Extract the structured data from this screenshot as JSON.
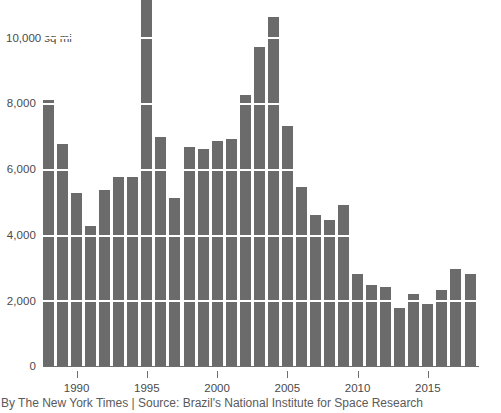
{
  "chart_data": {
    "type": "bar",
    "title": "",
    "subtitle": "",
    "xlabel": "",
    "ylabel": "10,000 sq mi",
    "unit_note": "10,000 sq mi",
    "ylim": [
      0,
      11500
    ],
    "xlim": [
      1987.5,
      2018.5
    ],
    "grid": true,
    "gridlines": [
      2000,
      4000,
      6000,
      8000,
      10000
    ],
    "legend": null,
    "ytick_labels": [
      "0",
      "2,000",
      "4,000",
      "6,000",
      "8,000",
      "10,000 sq mi"
    ],
    "ytick_values": [
      0,
      2000,
      4000,
      6000,
      8000,
      10000
    ],
    "xtick_labels": [
      "1990",
      "1995",
      "2000",
      "2005",
      "2010",
      "2015"
    ],
    "xtick_values": [
      1990,
      1995,
      2000,
      2005,
      2010,
      2015
    ],
    "categories": [
      1988,
      1989,
      1990,
      1991,
      1992,
      1993,
      1994,
      1995,
      1996,
      1997,
      1998,
      1999,
      2000,
      2001,
      2002,
      2003,
      2004,
      2005,
      2006,
      2007,
      2008,
      2009,
      2010,
      2011,
      2012,
      2013,
      2014,
      2015,
      2016,
      2017,
      2018
    ],
    "values": [
      8100,
      6750,
      5250,
      4250,
      5350,
      5750,
      5750,
      11200,
      6950,
      5100,
      6650,
      6600,
      6850,
      6900,
      8250,
      9700,
      10600,
      7300,
      5450,
      4600,
      4450,
      4900,
      2800,
      2450,
      2400,
      1750,
      2200,
      1900,
      2300,
      2950,
      2800
    ],
    "series_name": "Deforestation area"
  },
  "axis": {
    "y_top_label": "10,000 sq mi",
    "y_8000": "8,000",
    "y_6000": "6,000",
    "y_4000": "4,000",
    "y_2000": "2,000",
    "y_0": "0",
    "x_1990": "1990",
    "x_1995": "1995",
    "x_2000": "2000",
    "x_2005": "2005",
    "x_2010": "2010",
    "x_2015": "2015"
  },
  "footer": {
    "credit": "By The New York Times | Source: Brazil's National Institute for Space Research"
  },
  "colors": {
    "bar": "#6b6b6b",
    "grid": "#ffffff",
    "axis": "#6e6e6e",
    "text": "#4a4a4a",
    "caption": "#5a5a5a",
    "background": "#ffffff"
  }
}
